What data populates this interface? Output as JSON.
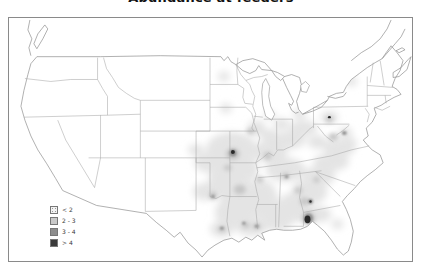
{
  "title": "Abundance at feeders",
  "legend": {
    "items": [
      {
        "label": "< 2",
        "color": "#f2f2f2",
        "stipple": true
      },
      {
        "label": "2 - 3",
        "color": "#c9c9c9",
        "stipple": false
      },
      {
        "label": "3 - 4",
        "color": "#8e8e8e",
        "stipple": false
      },
      {
        "label": "> 4",
        "color": "#3a3a3a",
        "stipple": false
      }
    ]
  },
  "chart_data": {
    "type": "heatmap",
    "subtype": "smoothed-abundance-contour-map-of-contiguous-united-states",
    "title": "Abundance at feeders",
    "legend_classes": [
      "< 2",
      "2 - 3",
      "3 - 4",
      "> 4"
    ],
    "palette": {
      "1": "#e4e4e4",
      "2": "#c6c6c6",
      "3": "#8e8e8e",
      "4": "#2b2b2b"
    },
    "regions": [
      {
        "x": 232,
        "y": 150,
        "rx": 26,
        "ry": 18,
        "level": 1
      },
      {
        "x": 210,
        "y": 163,
        "rx": 16,
        "ry": 10,
        "level": 1
      },
      {
        "x": 205,
        "y": 192,
        "rx": 12,
        "ry": 9,
        "level": 1
      },
      {
        "x": 228,
        "y": 183,
        "rx": 20,
        "ry": 18,
        "level": 1
      },
      {
        "x": 235,
        "y": 213,
        "rx": 20,
        "ry": 16,
        "level": 1
      },
      {
        "x": 222,
        "y": 230,
        "rx": 12,
        "ry": 8,
        "level": 1
      },
      {
        "x": 252,
        "y": 228,
        "rx": 16,
        "ry": 9,
        "level": 1
      },
      {
        "x": 262,
        "y": 200,
        "rx": 16,
        "ry": 20,
        "level": 1
      },
      {
        "x": 278,
        "y": 218,
        "rx": 16,
        "ry": 14,
        "level": 1
      },
      {
        "x": 295,
        "y": 208,
        "rx": 18,
        "ry": 15,
        "level": 1
      },
      {
        "x": 310,
        "y": 192,
        "rx": 18,
        "ry": 13,
        "level": 1
      },
      {
        "x": 320,
        "y": 176,
        "rx": 16,
        "ry": 10,
        "level": 1
      },
      {
        "x": 332,
        "y": 162,
        "rx": 18,
        "ry": 9,
        "level": 1
      },
      {
        "x": 340,
        "y": 148,
        "rx": 16,
        "ry": 9,
        "level": 1
      },
      {
        "x": 286,
        "y": 170,
        "rx": 20,
        "ry": 12,
        "level": 1
      },
      {
        "x": 270,
        "y": 152,
        "rx": 18,
        "ry": 11,
        "level": 1
      },
      {
        "x": 290,
        "y": 140,
        "rx": 16,
        "ry": 9,
        "level": 1
      },
      {
        "x": 304,
        "y": 128,
        "rx": 14,
        "ry": 8,
        "level": 1
      },
      {
        "x": 257,
        "y": 128,
        "rx": 9,
        "ry": 8,
        "level": 1
      },
      {
        "x": 270,
        "y": 136,
        "rx": 9,
        "ry": 7,
        "level": 1
      },
      {
        "x": 282,
        "y": 124,
        "rx": 8,
        "ry": 6,
        "level": 1
      },
      {
        "x": 300,
        "y": 114,
        "rx": 7,
        "ry": 5,
        "level": 1
      },
      {
        "x": 330,
        "y": 117,
        "rx": 9,
        "ry": 6,
        "level": 1
      },
      {
        "x": 346,
        "y": 133,
        "rx": 7,
        "ry": 6,
        "level": 1
      },
      {
        "x": 196,
        "y": 150,
        "rx": 8,
        "ry": 6,
        "level": 1
      },
      {
        "x": 226,
        "y": 108,
        "rx": 6,
        "ry": 5,
        "level": 1
      },
      {
        "x": 224,
        "y": 76,
        "rx": 6,
        "ry": 5,
        "level": 1
      },
      {
        "x": 352,
        "y": 81,
        "rx": 6,
        "ry": 5,
        "level": 1
      },
      {
        "x": 270,
        "y": 115,
        "rx": 6,
        "ry": 4,
        "level": 1
      },
      {
        "x": 320,
        "y": 215,
        "rx": 12,
        "ry": 8,
        "level": 1
      },
      {
        "x": 338,
        "y": 225,
        "rx": 6,
        "ry": 5,
        "level": 1
      },
      {
        "x": 245,
        "y": 170,
        "rx": 14,
        "ry": 12,
        "level": 1
      },
      {
        "x": 250,
        "y": 192,
        "rx": 12,
        "ry": 10,
        "level": 1
      },
      {
        "x": 318,
        "y": 142,
        "rx": 10,
        "ry": 7,
        "level": 1
      },
      {
        "x": 352,
        "y": 143,
        "rx": 6,
        "ry": 5,
        "level": 1
      },
      {
        "x": 233,
        "y": 154,
        "rx": 7,
        "ry": 6,
        "level": 2
      },
      {
        "x": 240,
        "y": 190,
        "rx": 6,
        "ry": 5,
        "level": 2
      },
      {
        "x": 213,
        "y": 196,
        "rx": 4,
        "ry": 4,
        "level": 2
      },
      {
        "x": 222,
        "y": 230,
        "rx": 4,
        "ry": 3,
        "level": 2
      },
      {
        "x": 246,
        "y": 226,
        "rx": 4,
        "ry": 3,
        "level": 2
      },
      {
        "x": 257,
        "y": 227,
        "rx": 4,
        "ry": 3,
        "level": 2
      },
      {
        "x": 305,
        "y": 202,
        "rx": 5,
        "ry": 4,
        "level": 2
      },
      {
        "x": 299,
        "y": 191,
        "rx": 4,
        "ry": 3,
        "level": 2
      },
      {
        "x": 317,
        "y": 180,
        "rx": 3,
        "ry": 3,
        "level": 2
      },
      {
        "x": 286,
        "y": 176,
        "rx": 4,
        "ry": 3,
        "level": 2
      },
      {
        "x": 268,
        "y": 156,
        "rx": 4,
        "ry": 4,
        "level": 2
      },
      {
        "x": 251,
        "y": 131,
        "rx": 4,
        "ry": 3,
        "level": 2
      },
      {
        "x": 334,
        "y": 137,
        "rx": 5,
        "ry": 4,
        "level": 2
      },
      {
        "x": 330,
        "y": 119,
        "rx": 4,
        "ry": 3,
        "level": 2
      },
      {
        "x": 309,
        "y": 219,
        "rx": 7,
        "ry": 7,
        "level": 2
      },
      {
        "x": 260,
        "y": 180,
        "rx": 4,
        "ry": 3,
        "level": 2
      },
      {
        "x": 228,
        "y": 168,
        "rx": 4,
        "ry": 3,
        "level": 2
      },
      {
        "x": 233,
        "y": 153,
        "rx": 3.5,
        "ry": 3.5,
        "level": 3
      },
      {
        "x": 311,
        "y": 202,
        "rx": 2.5,
        "ry": 2.5,
        "level": 3
      },
      {
        "x": 345,
        "y": 133,
        "rx": 2.5,
        "ry": 2,
        "level": 3
      },
      {
        "x": 257,
        "y": 227,
        "rx": 2,
        "ry": 1.5,
        "level": 3
      },
      {
        "x": 244,
        "y": 224,
        "rx": 1.8,
        "ry": 1.5,
        "level": 3
      },
      {
        "x": 222,
        "y": 229,
        "rx": 2,
        "ry": 1.5,
        "level": 3
      },
      {
        "x": 213,
        "y": 197,
        "rx": 1.8,
        "ry": 1.5,
        "level": 3
      },
      {
        "x": 287,
        "y": 177,
        "rx": 1.8,
        "ry": 1.5,
        "level": 3
      },
      {
        "x": 309,
        "y": 219,
        "rx": 4.5,
        "ry": 5,
        "level": 3
      },
      {
        "x": 233,
        "y": 152,
        "rx": 2,
        "ry": 2,
        "level": 4
      },
      {
        "x": 308,
        "y": 220,
        "rx": 3,
        "ry": 4,
        "level": 4
      },
      {
        "x": 330,
        "y": 117,
        "rx": 1.5,
        "ry": 1.2,
        "level": 4
      },
      {
        "x": 311,
        "y": 202,
        "rx": 1.2,
        "ry": 1.2,
        "level": 4
      }
    ]
  }
}
